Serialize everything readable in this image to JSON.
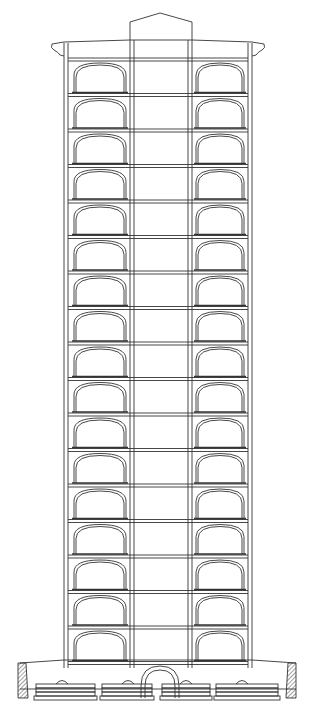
{
  "figure": {
    "type": "architectural-section-drawing",
    "stroke_color": "#333333",
    "background": "#ffffff",
    "floors": 17,
    "arches_per_floor": 2,
    "floor_top_y": 58,
    "floor_height": 35.5,
    "hatch_color": "#444444"
  }
}
